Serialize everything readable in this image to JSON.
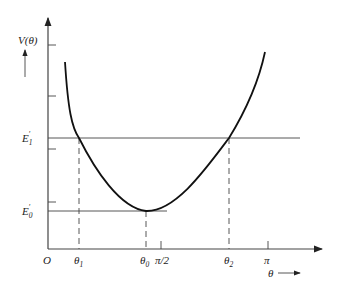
{
  "diagram": {
    "y_axis": {
      "label": "V(θ)",
      "label_main": "V(",
      "label_var": "θ",
      "label_close": ")"
    },
    "x_axis": {
      "label_var": "θ",
      "origin": "O",
      "ticks": [
        {
          "id": "theta1",
          "main": "θ",
          "sub": "1"
        },
        {
          "id": "theta0",
          "main": "θ",
          "sub": "0"
        },
        {
          "id": "pi_half",
          "main": "π/2",
          "sub": ""
        },
        {
          "id": "theta2",
          "main": "θ",
          "sub": "2"
        },
        {
          "id": "pi",
          "main": "π",
          "sub": ""
        }
      ]
    },
    "levels": [
      {
        "id": "E1",
        "main": "E",
        "sub": "1",
        "prime": "′"
      },
      {
        "id": "E0",
        "main": "E",
        "sub": "0",
        "prime": "′"
      }
    ],
    "curve": {
      "description": "Asymmetric potential well with minimum E0' at θ0, crossing E1' at θ1 and θ2",
      "color": "#111111"
    }
  }
}
